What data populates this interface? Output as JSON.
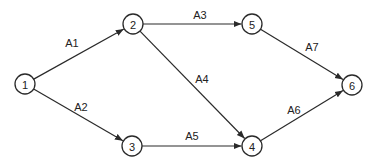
{
  "diagram": {
    "type": "activity-on-arrow network",
    "nodes": [
      {
        "id": "1",
        "label": "1",
        "x": 25,
        "y": 84
      },
      {
        "id": "2",
        "label": "2",
        "x": 133,
        "y": 24
      },
      {
        "id": "3",
        "label": "3",
        "x": 132,
        "y": 146
      },
      {
        "id": "4",
        "label": "4",
        "x": 252,
        "y": 146
      },
      {
        "id": "5",
        "label": "5",
        "x": 252,
        "y": 24
      },
      {
        "id": "6",
        "label": "6",
        "x": 352,
        "y": 85
      }
    ],
    "edges": [
      {
        "label": "A1",
        "from": "1",
        "to": "2",
        "lx": 72,
        "ly": 43
      },
      {
        "label": "A2",
        "from": "1",
        "to": "3",
        "lx": 81,
        "ly": 107
      },
      {
        "label": "A3",
        "from": "2",
        "to": "5",
        "lx": 200,
        "ly": 15
      },
      {
        "label": "A4",
        "from": "2",
        "to": "4",
        "lx": 202,
        "ly": 79
      },
      {
        "label": "A5",
        "from": "3",
        "to": "4",
        "lx": 192,
        "ly": 136
      },
      {
        "label": "A6",
        "from": "4",
        "to": "6",
        "lx": 294,
        "ly": 110
      },
      {
        "label": "A7",
        "from": "5",
        "to": "6",
        "lx": 312,
        "ly": 47
      }
    ],
    "node_radius": 10,
    "colors": {
      "stroke": "#2a2a2a",
      "text": "#222222",
      "background": "#ffffff"
    }
  }
}
